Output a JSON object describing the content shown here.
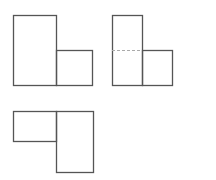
{
  "diagram": {
    "stroke_color": "#555555",
    "dash_color": "#aaaaaa",
    "figures": [
      {
        "name": "figure-1",
        "rects": [
          {
            "x": 13,
            "y": 15,
            "w": 43,
            "h": 70
          },
          {
            "x": 56,
            "y": 50,
            "w": 36,
            "h": 35
          }
        ],
        "dashed": []
      },
      {
        "name": "figure-2",
        "rects": [
          {
            "x": 112,
            "y": 15,
            "w": 30,
            "h": 70
          },
          {
            "x": 142,
            "y": 50,
            "w": 30,
            "h": 35
          }
        ],
        "dashed": [
          {
            "x1": 112,
            "y1": 50,
            "x2": 142,
            "y2": 50
          }
        ]
      },
      {
        "name": "figure-3",
        "rects": [
          {
            "x": 13,
            "y": 111,
            "w": 43,
            "h": 30
          },
          {
            "x": 56,
            "y": 111,
            "w": 37,
            "h": 61
          }
        ],
        "dashed": []
      }
    ]
  }
}
